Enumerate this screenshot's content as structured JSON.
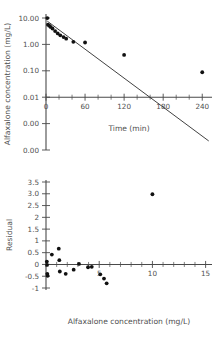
{
  "figure": {
    "background": "#ffffff",
    "point_color": "#111111",
    "axis_color": "#4a4a4a"
  },
  "chart_data": [
    {
      "id": "concentration-vs-time",
      "type": "scatter",
      "title": "",
      "xlabel": "Time (min)",
      "ylabel": "Alfaxalone concentration (mg/L)",
      "yscale": "log",
      "xlim": [
        0,
        255
      ],
      "ylim": [
        0.0001,
        10
      ],
      "grid": false,
      "legend": null,
      "xticks": [
        0,
        60,
        120,
        180,
        240
      ],
      "xticklabels": [
        "0",
        "60",
        "120",
        "180",
        "240"
      ],
      "yticks": [
        10,
        1,
        0.1,
        0.01,
        0.001,
        0.0001
      ],
      "yticklabels": [
        "10.00",
        "1.00",
        "0.10",
        "0.01",
        "0.00",
        "0.00"
      ],
      "points": [
        {
          "x": 2,
          "y": 9.9
        },
        {
          "x": 3,
          "y": 5.6
        },
        {
          "x": 5,
          "y": 5.1
        },
        {
          "x": 7,
          "y": 4.6
        },
        {
          "x": 10,
          "y": 4.0
        },
        {
          "x": 14,
          "y": 3.2
        },
        {
          "x": 18,
          "y": 2.6
        },
        {
          "x": 22,
          "y": 2.2
        },
        {
          "x": 27,
          "y": 1.9
        },
        {
          "x": 31,
          "y": 1.65
        },
        {
          "x": 42,
          "y": 1.25
        },
        {
          "x": 60,
          "y": 1.18
        },
        {
          "x": 120,
          "y": 0.4
        },
        {
          "x": 240,
          "y": 0.088
        }
      ],
      "fit_line": {
        "label": "log-linear regression",
        "x_start": 2,
        "y_start": 7.6,
        "x_end": 250,
        "y_end": 0.00022
      }
    },
    {
      "id": "residual-plot",
      "type": "scatter",
      "title": "",
      "xlabel": "Alfaxalone concentration (mg/L)",
      "ylabel": "Residual",
      "yscale": "linear",
      "xlim": [
        0,
        15.6
      ],
      "ylim": [
        -1,
        3.5
      ],
      "grid": false,
      "legend": null,
      "xticks": [
        0,
        5,
        10,
        15
      ],
      "xticklabels": [
        "",
        "5",
        "10",
        "15"
      ],
      "yticks": [
        3.5,
        3,
        2.5,
        2,
        1.5,
        1,
        0.5,
        0,
        -0.5,
        -1
      ],
      "yticklabels": [
        "3.5",
        "3.0",
        "2.5",
        "2",
        "1.5",
        "1",
        "0.5",
        "0",
        "-0.5",
        "-1"
      ],
      "zero_line": 0,
      "points": [
        {
          "x": 0.08,
          "y": 0.12
        },
        {
          "x": 0.1,
          "y": -0.02
        },
        {
          "x": 0.12,
          "y": -0.4
        },
        {
          "x": 0.15,
          "y": -0.48
        },
        {
          "x": 0.55,
          "y": 0.42
        },
        {
          "x": 1.2,
          "y": 0.67
        },
        {
          "x": 1.25,
          "y": 0.18
        },
        {
          "x": 1.3,
          "y": -0.3
        },
        {
          "x": 1.85,
          "y": -0.4
        },
        {
          "x": 2.6,
          "y": -0.22
        },
        {
          "x": 3.1,
          "y": 0.02
        },
        {
          "x": 3.95,
          "y": -0.12
        },
        {
          "x": 4.3,
          "y": -0.1
        },
        {
          "x": 5.1,
          "y": -0.42
        },
        {
          "x": 5.45,
          "y": -0.6
        },
        {
          "x": 5.7,
          "y": -0.8
        },
        {
          "x": 10.0,
          "y": 2.98
        }
      ]
    }
  ]
}
